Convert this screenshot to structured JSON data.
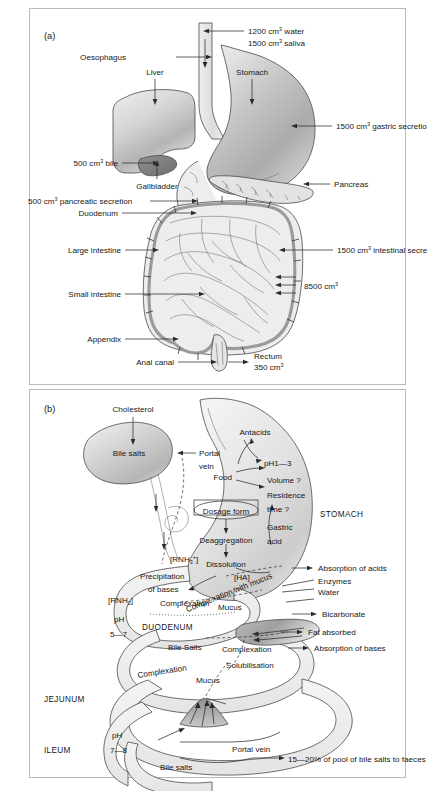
{
  "figure": {
    "panel_a": {
      "label": "(a)",
      "annotations": {
        "water": "1200 cm",
        "water_sup": "3",
        "water_tail": " water",
        "saliva": "1500 cm",
        "saliva_sup": "3",
        "saliva_tail": " saliva",
        "oesophagus": "Oesophagus",
        "liver": "Liver",
        "stomach": "Stomach",
        "gastric": "1500 cm",
        "gastric_sup": "3",
        "gastric_tail": " gastric secretion",
        "bile": "500 cm",
        "bile_sup": "3",
        "bile_tail": " bile",
        "gallbladder": "Gallbladder",
        "pancreas": "Pancreas",
        "pancreatic": "500 cm",
        "pancreatic_sup": "3",
        "pancreatic_tail": " pancreatic secretion",
        "duodenum": "Duodenum",
        "large_intestine": "Large intestine",
        "intestinal": "1500 cm",
        "intestinal_sup": "3",
        "intestinal_tail": " intestinal secretion",
        "small_intestine": "Small intestine",
        "total": "8500 cm",
        "total_sup": "3",
        "appendix": "Appendix",
        "anal_canal": "Anal canal",
        "rectum": "Rectum",
        "rectum_vol": "350 cm",
        "rectum_sup": "3"
      }
    },
    "panel_b": {
      "label": "(b)",
      "annotations": {
        "cholesterol": "Cholesterol",
        "bile_salts": "Bile salts",
        "portal": "Portal",
        "vein": "vein",
        "antacids": "Antacids",
        "ph13": "pH1—3",
        "food": "Food",
        "volume": "Volume ?",
        "residence": "Residence",
        "time": "time ?",
        "gastric": "Gastric",
        "acid": "acid",
        "stomach": "STOMACH",
        "dosage_form": "Dosage form",
        "deaggregation": "Deaggregation",
        "dissolution": "Dissolution",
        "rnh3": "[RNH",
        "rnh3_sub": "3",
        "rnh3_sup": "+",
        "rnh3_tail": "]",
        "ha": "[HA]",
        "precipitation": "Precipitation",
        "of_bases": "of bases",
        "rnh2": "[RNH",
        "rnh2_sub": "2",
        "rnh2_tail": "]",
        "ph57_a": "pH",
        "ph57_b": "5—7",
        "complexation_mucus": "Complexation with mucus",
        "complexation_1": "Complexation",
        "mucus_1": "Mucus",
        "duodenum": "DUODENUM",
        "bile_salts_2": "Bile Salts",
        "complexation_2": "Complexation",
        "solubilisation": "Solubilisation",
        "complexation_3": "Complexation",
        "mucus_2": "Mucus",
        "absorption_acids": "Absorption of acids",
        "enzymes": "Enzymes",
        "water": "Water",
        "bicarbonate": "Bicarbonate",
        "fat_absorbed": "Fat absorbed",
        "absorption_bases": "Absorption of bases",
        "jejunum": "JEJUNUM",
        "ileum": "ILEUM",
        "ph78_a": "pH",
        "ph78_b": "7—8",
        "portal_vein": "Portal vein",
        "bile_salts_3": "Bile salts",
        "faeces": "15—20% of pool of bile salts to faeces"
      }
    },
    "caption_cutoff": ""
  }
}
